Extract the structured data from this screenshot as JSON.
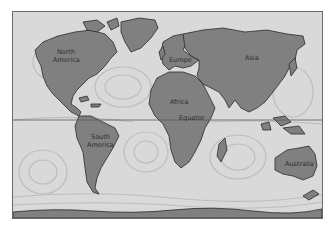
{
  "map": {
    "title": "World ocean currents",
    "colors": {
      "ocean": "#d9d9d9",
      "land": "#808080",
      "outline": "#2a2a2a",
      "current": "#b9b9b9",
      "equator": "#5a5a5a"
    },
    "labels": {
      "north_america_line1": "North",
      "north_america_line2": "America",
      "south_america_line1": "South",
      "south_america_line2": "America",
      "europe": "Europe",
      "asia": "Asia",
      "africa": "Africa",
      "australia": "Australia",
      "equator": "Equator"
    }
  }
}
